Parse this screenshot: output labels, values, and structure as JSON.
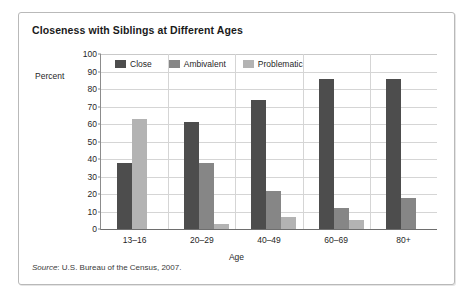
{
  "chart_data": {
    "type": "bar",
    "title": "Closeness with Siblings at Different Ages",
    "xlabel": "Age",
    "ylabel": "Percent",
    "ylim": [
      0,
      100
    ],
    "ytick_step": 10,
    "yticks": [
      100,
      90,
      80,
      70,
      60,
      50,
      40,
      30,
      20,
      10,
      0
    ],
    "grid": true,
    "legend_position": "top",
    "categories": [
      "13–16",
      "20–29",
      "40–49",
      "60–69",
      "80+"
    ],
    "series": [
      {
        "name": "Close",
        "color": "#4d4d4d",
        "values": [
          38,
          61,
          74,
          86,
          86
        ]
      },
      {
        "name": "Ambivalent",
        "color": "#868686",
        "values": [
          0,
          38,
          22,
          12,
          18
        ]
      },
      {
        "name": "Problematic",
        "color": "#b3b3b3",
        "values": [
          63,
          3,
          7,
          5,
          0
        ]
      }
    ],
    "source": {
      "label": "Source",
      "text": ": U.S. Bureau of the Census, 2007."
    }
  }
}
